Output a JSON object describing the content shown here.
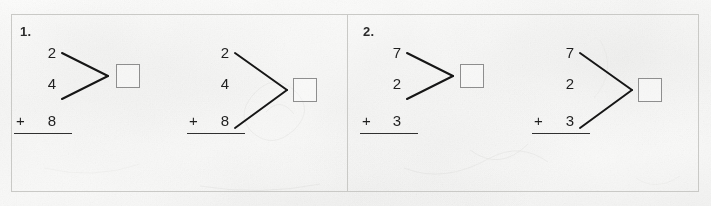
{
  "worksheet": {
    "background_color": "#fbfbfa",
    "frame_color": "#c9c9c6",
    "ink_color": "#1f1f1f",
    "box_border_color": "#8e8e8e"
  },
  "problems": [
    {
      "number_label": "1.",
      "subproblems": [
        {
          "id": "1a",
          "addends": [
            "2",
            "4"
          ],
          "third_addend": "",
          "plus": "+",
          "last_addend": "8",
          "answer": "",
          "bracket_pairs": [
            "2",
            "4"
          ],
          "bracket_span": "short"
        },
        {
          "id": "1b",
          "addends": [
            "2",
            "4"
          ],
          "third_addend": "",
          "plus": "+",
          "last_addend": "8",
          "answer": "",
          "bracket_pairs": [
            "2",
            "8"
          ],
          "bracket_span": "tall"
        }
      ]
    },
    {
      "number_label": "2.",
      "subproblems": [
        {
          "id": "2a",
          "addends": [
            "7",
            "2"
          ],
          "third_addend": "",
          "plus": "+",
          "last_addend": "3",
          "answer": "",
          "bracket_pairs": [
            "7",
            "2"
          ],
          "bracket_span": "short"
        },
        {
          "id": "2b",
          "addends": [
            "7",
            "2"
          ],
          "third_addend": "",
          "plus": "+",
          "last_addend": "3",
          "answer": "",
          "bracket_pairs": [
            "7",
            "3"
          ],
          "bracket_span": "tall"
        }
      ]
    }
  ]
}
